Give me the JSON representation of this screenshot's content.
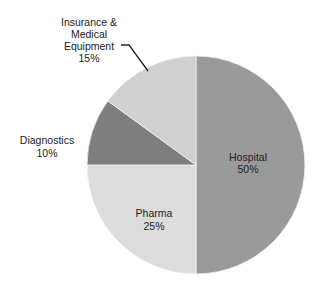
{
  "chart_data": {
    "type": "pie",
    "title": "",
    "start_angle_deg": 0,
    "direction": "clockwise",
    "legend": "none",
    "slices": [
      {
        "label": "Hospital",
        "value": 50,
        "value_label": "50%",
        "color": "#9a9a9a"
      },
      {
        "label": "Pharma",
        "value": 25,
        "value_label": "25%",
        "color": "#dcdcdc"
      },
      {
        "label": "Diagnostics",
        "value": 10,
        "value_label": "10%",
        "color": "#7e7e7e"
      },
      {
        "label": "Insurance & Medical Equipment",
        "value": 15,
        "value_label": "15%",
        "color": "#d0d0d0"
      }
    ]
  },
  "labels": {
    "hospital": {
      "name": "Hospital",
      "pct": "50%"
    },
    "pharma": {
      "name": "Pharma",
      "pct": "25%"
    },
    "diagnostics": {
      "name": "Diagnostics",
      "pct": "10%"
    },
    "insurance": {
      "line1": "Insurance &",
      "line2": "Medical",
      "line3": "Equipment",
      "pct": "15%"
    }
  },
  "geometry": {
    "cx": 196,
    "cy": 165,
    "r": 109
  }
}
